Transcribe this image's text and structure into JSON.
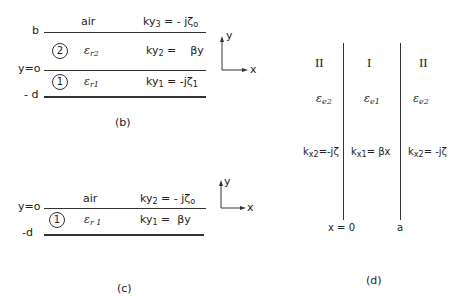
{
  "panel_b": {
    "caption": "(b)",
    "labels": {
      "b": "b",
      "y0": "y=o",
      "neg_d": "- d"
    },
    "layer_air": {
      "name": "air",
      "k_main": "ky",
      "k_sub": "3",
      "k_rhs": " = - jζ",
      "k_rhs_sub": "o"
    },
    "layer_2": {
      "circle": "2",
      "eps": "ε",
      "eps_sub": "r2",
      "k_main": "ky",
      "k_sub": "2",
      "k_rhs": " =    βy"
    },
    "layer_1": {
      "circle": "1",
      "eps": "ε",
      "eps_sub": "r1",
      "k_main": "ky",
      "k_sub": "1",
      "k_rhs": " = -jζ",
      "k_rhs_sub": "1"
    },
    "axis": {
      "x": "x",
      "y": "y"
    }
  },
  "panel_c": {
    "caption": "(c)",
    "labels": {
      "y0": "y=o",
      "neg_d": "-d"
    },
    "layer_air": {
      "name": "air",
      "k_main": "ky",
      "k_sub": "2",
      "k_rhs": " = - jζ",
      "k_rhs_sub": "o"
    },
    "layer_1": {
      "circle": "1",
      "eps": "ε",
      "eps_sub": "r 1",
      "k_main": "ky",
      "k_sub": "1",
      "k_rhs": " =  βy"
    },
    "axis": {
      "x": "x",
      "y": "y"
    }
  },
  "panel_d": {
    "caption": "(d)",
    "regions": [
      {
        "roman": "II",
        "eps": "ε",
        "eps_sub": "e2",
        "k_main": "k",
        "k_sub": "x2",
        "k_rhs": "=-jζ"
      },
      {
        "roman": "I",
        "eps": "ε",
        "eps_sub": "e1",
        "k_main": "k",
        "k_sub": "x1",
        "k_rhs": "= βx"
      },
      {
        "roman": "II",
        "eps": "ε",
        "eps_sub": "e2",
        "k_main": "k",
        "k_sub": "x2",
        "k_rhs": "= -jζ"
      }
    ],
    "labels": {
      "x0": "x = 0",
      "a": "a"
    }
  }
}
